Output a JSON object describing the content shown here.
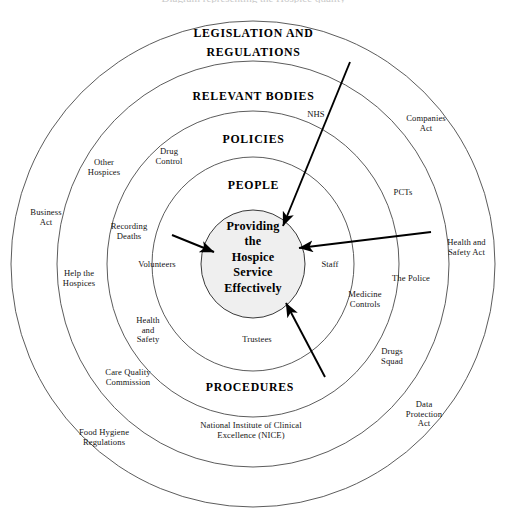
{
  "page": {
    "cropped_top_text": "Diagram representing the Hospice quality"
  },
  "diagram": {
    "type": "concentric-rings",
    "center_label": "Providing\nthe\nHospice\nService\nEffectively",
    "center_lines": [
      "Providing",
      "the",
      "Hospice",
      "Service",
      "Effectively"
    ],
    "colors": {
      "ring_stroke": "#4a4a4a",
      "core_fill": "#efefef",
      "core_stroke": "#3a3a3a",
      "arrow": "#000000",
      "text": "#000000"
    },
    "rings": [
      {
        "name": "legislation-and-regulations",
        "label_lines": [
          "LEGISLATION AND",
          "REGULATIONS"
        ]
      },
      {
        "name": "relevant-bodies",
        "label_lines": [
          "RELEVANT BODIES"
        ]
      },
      {
        "name": "policies",
        "label_lines": [
          "POLICIES"
        ]
      },
      {
        "name": "people",
        "label_lines": [
          "PEOPLE"
        ]
      },
      {
        "name": "procedures",
        "label_lines": [
          "PROCEDURES"
        ]
      }
    ],
    "items": [
      {
        "name": "business-act",
        "lines": [
          "Business",
          "Act"
        ]
      },
      {
        "name": "health-and-safety-act",
        "lines": [
          "Health and",
          "Safety Act"
        ]
      },
      {
        "name": "companies-act",
        "lines": [
          "Companies",
          "Act"
        ]
      },
      {
        "name": "data-protection-act",
        "lines": [
          "Data",
          "Protection",
          "Act"
        ]
      },
      {
        "name": "food-hygiene-regulations",
        "lines": [
          "Food Hygiene",
          "Regulations"
        ]
      },
      {
        "name": "national-institute-of-clinical-excellence",
        "lines": [
          "National Institute of Clinical",
          "Excellence (NICE)"
        ]
      },
      {
        "name": "other-hospices",
        "lines": [
          "Other",
          "Hospices"
        ]
      },
      {
        "name": "help-the-hospices",
        "lines": [
          "Help the",
          "Hospices"
        ]
      },
      {
        "name": "nhs",
        "lines": [
          "NHS"
        ]
      },
      {
        "name": "pcts",
        "lines": [
          "PCTs"
        ]
      },
      {
        "name": "the-police",
        "lines": [
          "The Police"
        ]
      },
      {
        "name": "drugs-squad",
        "lines": [
          "Drugs",
          "Squad"
        ]
      },
      {
        "name": "care-quality-commission",
        "lines": [
          "Care Quality",
          "Commission"
        ]
      },
      {
        "name": "drug-control",
        "lines": [
          "Drug",
          "Control"
        ]
      },
      {
        "name": "recording-deaths",
        "lines": [
          "Recording",
          "Deaths"
        ]
      },
      {
        "name": "medicine-controls",
        "lines": [
          "Medicine",
          "Controls"
        ]
      },
      {
        "name": "health-and-safety",
        "lines": [
          "Health",
          "and",
          "Safety"
        ]
      },
      {
        "name": "volunteers",
        "lines": [
          "Volunteers"
        ]
      },
      {
        "name": "staff",
        "lines": [
          "Staff"
        ]
      },
      {
        "name": "trustees",
        "lines": [
          "Trustees"
        ]
      }
    ],
    "arrows": [
      {
        "name": "arrow-from-top-right",
        "from": "upper-right",
        "to": "center"
      },
      {
        "name": "arrow-from-left",
        "from": "left",
        "to": "center"
      },
      {
        "name": "arrow-from-right",
        "from": "right",
        "to": "center"
      },
      {
        "name": "arrow-from-bottom-right",
        "from": "lower-right",
        "to": "center"
      }
    ]
  }
}
